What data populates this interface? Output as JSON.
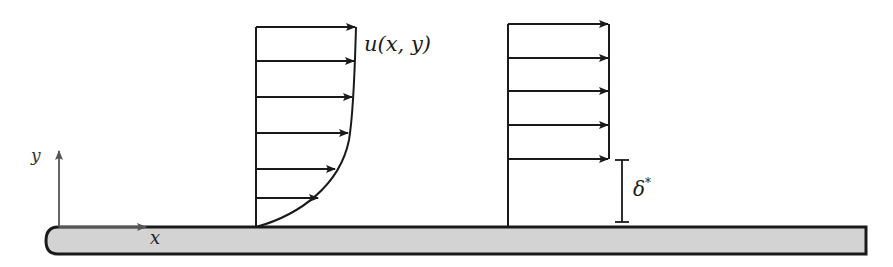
{
  "diagram": {
    "type": "boundary-layer velocity profiles over flat plate",
    "labels": {
      "velocity_profile": "u(x, y)",
      "y_axis": "y",
      "x_axis": "x",
      "displacement_thickness": "δ",
      "displacement_thickness_sup": "*"
    },
    "colors": {
      "plate_fill": "#d3d3d3",
      "stroke": "#1a1a1a",
      "axis_stroke": "#555555",
      "background": "#ffffff"
    },
    "boundary_layer_profile": {
      "x_base": 256,
      "arrow_y": [
        27,
        61,
        97,
        133,
        169,
        198
      ],
      "arrow_tip_x": [
        355,
        354,
        352,
        348,
        335,
        318
      ]
    },
    "displaced_uniform_profile": {
      "x_base": 508,
      "right_x": 609,
      "arrow_y": [
        24,
        58,
        91,
        125,
        159
      ]
    }
  }
}
